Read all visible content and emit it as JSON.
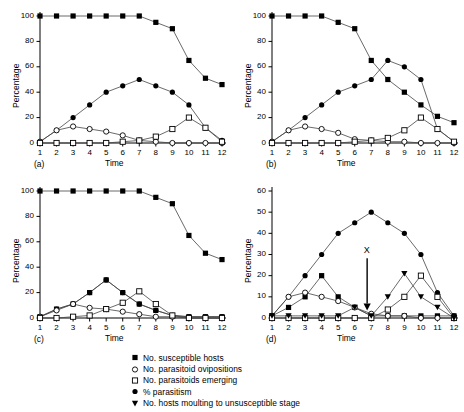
{
  "figure": {
    "xlabel": "Time",
    "ylabel": "Percentage",
    "panel_labels": [
      "(a)",
      "(b)",
      "(c)",
      "(d)"
    ],
    "annotation": {
      "text": "X",
      "panel": "(d)",
      "x": 6.75
    }
  },
  "legend": {
    "items": [
      {
        "marker": "filled-square",
        "label": "No. susceptible hosts"
      },
      {
        "marker": "open-circle",
        "label": "No. parasitoid ovipositions"
      },
      {
        "marker": "open-square",
        "label": "No. parasitoids emerging"
      },
      {
        "marker": "filled-circle",
        "label": "% parasitism"
      },
      {
        "marker": "filled-triangle-down",
        "label": "No. hosts moulting to unsusceptible stage"
      }
    ]
  },
  "chart_data": [
    {
      "type": "line",
      "title": "(a)",
      "xlabel": "Time",
      "ylabel": "Percentage",
      "x": [
        1,
        2,
        3,
        4,
        5,
        6,
        7,
        8,
        9,
        10,
        11,
        12
      ],
      "xlim": [
        1,
        12
      ],
      "ylim": [
        0,
        100
      ],
      "yticks": [
        0,
        20,
        40,
        60,
        80,
        100
      ],
      "xticks": [
        1,
        2,
        3,
        4,
        5,
        6,
        7,
        8,
        9,
        10,
        11,
        12
      ],
      "grid": false,
      "legend_position": "below-figure",
      "series": [
        {
          "name": "No. susceptible hosts",
          "marker": "filled-square",
          "values": [
            100,
            100,
            100,
            100,
            100,
            100,
            100,
            95,
            90,
            65,
            51,
            46
          ]
        },
        {
          "name": "% parasitism",
          "marker": "filled-circle",
          "values": [
            1,
            10,
            20,
            30,
            40,
            45,
            50,
            45,
            40,
            30,
            12,
            2
          ]
        },
        {
          "name": "No. parasitoid ovipositions",
          "marker": "open-circle",
          "values": [
            1,
            10,
            13,
            11,
            9,
            6,
            2,
            1,
            0,
            0,
            0,
            0
          ]
        },
        {
          "name": "No. parasitoids emerging",
          "marker": "open-square",
          "values": [
            0,
            0,
            0,
            0,
            0,
            1,
            2,
            5,
            11,
            20,
            12,
            1
          ]
        }
      ]
    },
    {
      "type": "line",
      "title": "(b)",
      "xlabel": "Time",
      "ylabel": "Percentage",
      "x": [
        1,
        2,
        3,
        4,
        5,
        6,
        7,
        8,
        9,
        10,
        11,
        12
      ],
      "xlim": [
        1,
        12
      ],
      "ylim": [
        0,
        100
      ],
      "yticks": [
        0,
        20,
        40,
        60,
        80,
        100
      ],
      "xticks": [
        1,
        2,
        3,
        4,
        5,
        6,
        7,
        8,
        9,
        10,
        11,
        12
      ],
      "grid": false,
      "legend_position": "below-figure",
      "series": [
        {
          "name": "No. susceptible hosts",
          "marker": "filled-square",
          "values": [
            100,
            100,
            100,
            100,
            95,
            90,
            65,
            50,
            40,
            30,
            21,
            16
          ]
        },
        {
          "name": "% parasitism",
          "marker": "filled-circle",
          "values": [
            1,
            10,
            20,
            30,
            40,
            45,
            50,
            65,
            60,
            50,
            11,
            1
          ]
        },
        {
          "name": "No. parasitoid ovipositions",
          "marker": "open-circle",
          "values": [
            1,
            10,
            13,
            11,
            8,
            3,
            2,
            1,
            1,
            0,
            0,
            0
          ]
        },
        {
          "name": "No. parasitoids emerging",
          "marker": "open-square",
          "values": [
            0,
            0,
            0,
            0,
            0,
            1,
            2,
            4,
            10,
            20,
            11,
            1
          ]
        }
      ]
    },
    {
      "type": "line",
      "title": "(c)",
      "xlabel": "Time",
      "ylabel": "Percentage",
      "x": [
        1,
        2,
        3,
        4,
        5,
        6,
        7,
        8,
        9,
        10,
        11,
        12
      ],
      "xlim": [
        1,
        12
      ],
      "ylim": [
        0,
        100
      ],
      "yticks": [
        0,
        20,
        40,
        60,
        80,
        100
      ],
      "xticks": [
        1,
        2,
        3,
        4,
        5,
        6,
        7,
        8,
        9,
        10,
        11,
        12
      ],
      "grid": false,
      "legend_position": "below-figure",
      "series": [
        {
          "name": "No. susceptible hosts",
          "marker": "filled-square",
          "values": [
            1,
            7,
            11,
            20,
            30,
            20,
            11,
            6,
            2,
            1,
            1,
            1
          ]
        },
        {
          "name": "% parasitism",
          "marker": "filled-circle",
          "values": [
            1,
            7,
            11,
            20,
            30,
            20,
            11,
            6,
            2,
            1,
            1,
            1
          ]
        },
        {
          "name": "No. parasitoid ovipositions",
          "marker": "open-circle",
          "values": [
            1,
            6,
            11,
            8,
            7,
            5,
            3,
            1,
            1,
            0,
            0,
            0
          ]
        },
        {
          "name": "No. parasitoids emerging",
          "marker": "open-square",
          "values": [
            0,
            0,
            1,
            2,
            7,
            12,
            21,
            11,
            2,
            0,
            0,
            0
          ]
        },
        {
          "name": "No. susceptible hosts (top)",
          "marker": "filled-square-top",
          "values": [
            100,
            100,
            100,
            100,
            100,
            100,
            100,
            95,
            90,
            65,
            51,
            46
          ]
        }
      ]
    },
    {
      "type": "line",
      "title": "(d)",
      "xlabel": "Time",
      "ylabel": "Percentage",
      "x": [
        1,
        2,
        3,
        4,
        5,
        6,
        7,
        8,
        9,
        10,
        11,
        12
      ],
      "xlim": [
        1,
        12
      ],
      "ylim": [
        0,
        60
      ],
      "yticks": [
        0,
        10,
        20,
        30,
        40,
        50,
        60
      ],
      "xticks": [
        1,
        2,
        3,
        4,
        5,
        6,
        7,
        8,
        9,
        10,
        11,
        12
      ],
      "grid": false,
      "legend_position": "below-figure",
      "annotation": {
        "text": "X",
        "x": 6.75,
        "arrow": "down"
      },
      "series": [
        {
          "name": "% parasitism",
          "marker": "filled-circle",
          "values": [
            1,
            10,
            20,
            30,
            40,
            45,
            50,
            45,
            40,
            30,
            12,
            1
          ]
        },
        {
          "name": "No. susceptible hosts",
          "marker": "filled-square",
          "values": [
            1,
            5,
            10,
            20,
            10,
            5,
            1,
            1,
            1,
            1,
            1,
            1
          ]
        },
        {
          "name": "No. parasitoid ovipositions",
          "marker": "open-circle",
          "values": [
            1,
            10,
            12,
            10,
            8,
            5,
            2,
            1,
            1,
            0,
            0,
            0
          ]
        },
        {
          "name": "No. parasitoids emerging",
          "marker": "open-square",
          "values": [
            0,
            0,
            0,
            0,
            0,
            0,
            0,
            4,
            10,
            20,
            10,
            0
          ]
        },
        {
          "name": "No. hosts moulting to unsusceptible stage",
          "marker": "filled-triangle-down",
          "values": [
            1,
            1,
            1,
            1,
            1,
            5,
            1,
            10,
            21,
            10,
            5,
            0
          ]
        }
      ]
    }
  ]
}
